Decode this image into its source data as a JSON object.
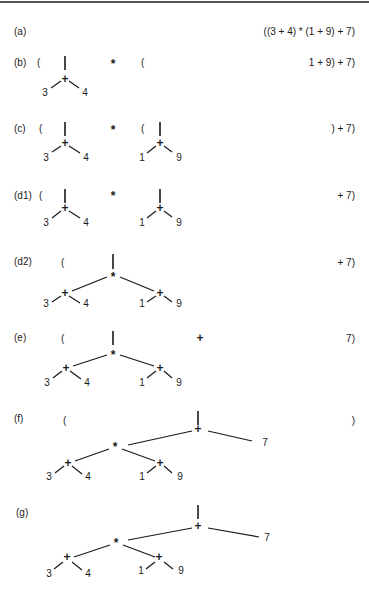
{
  "figure": {
    "steps": [
      {
        "label": "(a)",
        "remaining": "((3 + 4) * (1 + 9) + 7)"
      },
      {
        "label": "(b)",
        "remaining": "1 + 9) + 7)",
        "stack": [
          "(",
          "tree:3+4",
          "*",
          "("
        ]
      },
      {
        "label": "(c)",
        "remaining": ") + 7)",
        "stack": [
          "(",
          "tree:3+4",
          "*",
          "(",
          "tree:1+9"
        ]
      },
      {
        "label": "(d1)",
        "remaining": "+ 7)",
        "stack": [
          "(",
          "tree:3+4",
          "*",
          "tree:1+9"
        ]
      },
      {
        "label": "(d2)",
        "remaining": "+ 7)",
        "stack": [
          "(",
          "tree:(3+4)*(1+9)"
        ]
      },
      {
        "label": "(e)",
        "remaining": "7)",
        "stack": [
          "(",
          "tree:(3+4)*(1+9)",
          "+"
        ]
      },
      {
        "label": "(f)",
        "remaining": ")",
        "stack": [
          "(",
          "tree:(3+4)*(1+9)+7"
        ]
      },
      {
        "label": "(g)",
        "remaining": "",
        "stack": [
          "tree:(3+4)*(1+9)+7"
        ]
      }
    ],
    "symbols": {
      "open_paren": "(",
      "close_paren": ")",
      "plus": "+",
      "times": "*",
      "stem": "|"
    },
    "leaves": {
      "three": "3",
      "four": "4",
      "one": "1",
      "nine": "9",
      "seven": "7"
    }
  }
}
